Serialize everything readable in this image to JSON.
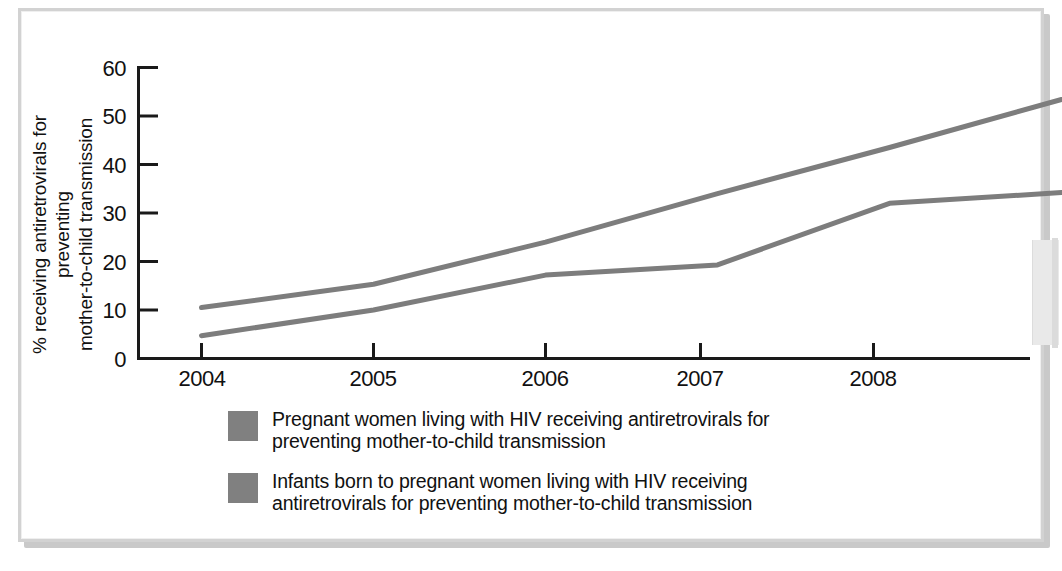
{
  "figure": {
    "ylabel_line1": "% receiving antiretrovirals for preventing",
    "ylabel_line2": "mother-to-child transmission",
    "series1_color": "#7d7d7d",
    "series2_color": "#7d7d7d",
    "axis_color": "#1a1a1a",
    "frame_color": "#d2d2d2"
  },
  "legend": {
    "items": [
      {
        "swatch": "#808080",
        "line1": "Pregnant women living with HIV receiving antiretrovirals for",
        "line2": "preventing mother-to-child transmission"
      },
      {
        "swatch": "#808080",
        "line1": "Infants born to pregnant women living with HIV receiving",
        "line2": "antiretrovirals for preventing mother-to-child transmission"
      }
    ]
  },
  "chart_data": {
    "type": "line",
    "title": "",
    "xlabel": "",
    "ylabel": "% receiving antiretrovirals for preventing mother-to-child transmission",
    "xlim": [
      2003.6,
      2009.3
    ],
    "ylim": [
      0,
      60
    ],
    "yticks": [
      0,
      10,
      20,
      30,
      40,
      50,
      60
    ],
    "ytick_labels": [
      "0",
      "10",
      "20",
      "30",
      "40",
      "50",
      "60"
    ],
    "xticks": [
      2004,
      2005,
      2006,
      2007,
      2008
    ],
    "xtick_labels": [
      "2004",
      "2005",
      "2006",
      "2007",
      "2008"
    ],
    "grid": false,
    "legend_position": "below",
    "x": [
      2004,
      2005,
      2006,
      2007,
      2008,
      2009
    ],
    "series": [
      {
        "name": "Pregnant women living with HIV receiving antiretrovirals for preventing mother-to-child transmission",
        "color": "#7d7d7d",
        "values": [
          10.5,
          15.3,
          24.0,
          34.0,
          43.5,
          53.4
        ]
      },
      {
        "name": "Infants born to pregnant women living with HIV receiving antiretrovirals for preventing mother-to-child transmission",
        "color": "#7d7d7d",
        "values": [
          4.7,
          10.0,
          17.2,
          19.3,
          32.0,
          34.2
        ]
      }
    ]
  }
}
